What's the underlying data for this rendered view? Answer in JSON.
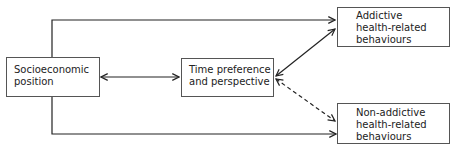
{
  "diagram": {
    "nodes": {
      "socioeconomic": {
        "label": "Socioeconomic\nposition"
      },
      "time_pref": {
        "label": "Time preference\nand perspective"
      },
      "addictive": {
        "label": "Addictive\nhealth-related\nbehaviours"
      },
      "non_addictive": {
        "label": "Non-addictive\nhealth-related\nbehaviours"
      }
    },
    "edges": [
      {
        "from": "socioeconomic",
        "to": "addictive",
        "style": "solid",
        "direction": "forward"
      },
      {
        "from": "socioeconomic",
        "to": "non_addictive",
        "style": "solid",
        "direction": "forward"
      },
      {
        "from": "socioeconomic",
        "to": "time_pref",
        "style": "solid",
        "direction": "both"
      },
      {
        "from": "time_pref",
        "to": "addictive",
        "style": "solid",
        "direction": "both"
      },
      {
        "from": "time_pref",
        "to": "non_addictive",
        "style": "dashed",
        "direction": "both"
      }
    ],
    "colors": {
      "line": "#222222",
      "box_border": "#555555"
    }
  }
}
